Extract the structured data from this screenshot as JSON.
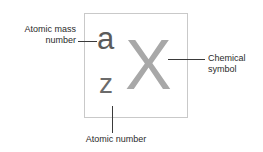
{
  "diagram": {
    "symbol_box": {
      "mass_number": "a",
      "atomic_number": "z",
      "chemical_symbol": "X"
    },
    "callouts": [
      {
        "id": "mass-number",
        "text": "Atomic mass\nnumber",
        "position": "left"
      },
      {
        "id": "chemical-symbol",
        "text": "Chemical\nsymbol",
        "position": "right"
      },
      {
        "id": "atomic-number",
        "text": "Atomic number",
        "position": "bottom"
      }
    ],
    "colors": {
      "background": "#ffffff",
      "box_border": "#c9c9c9",
      "mass_number_text": "#5b5b5b",
      "atomic_number_text": "#6b6b6b",
      "chemical_symbol_text": "#a8a8a8",
      "label_text": "#2b2b2b",
      "leader_line": "#3a3a3a"
    }
  }
}
